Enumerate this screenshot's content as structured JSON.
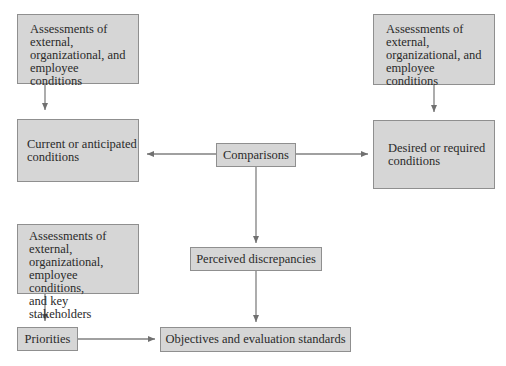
{
  "diagram": {
    "nodes": {
      "assess_current": {
        "label": "Assessments of external, organizational, and employee conditions",
        "lines": [
          "Assessments of",
          "external,",
          "organizational, and",
          "employee conditions"
        ]
      },
      "current": {
        "label": "Current or anticipated conditions",
        "lines": [
          "Current or anticipated",
          "conditions"
        ]
      },
      "comparisons": {
        "label": "Comparisons"
      },
      "assess_desired": {
        "label": "Assessments of external, organizational, and employee conditions",
        "lines": [
          "Assessments of",
          "external,",
          "organizational, and",
          "employee conditions"
        ]
      },
      "desired": {
        "label": "Desired or required conditions",
        "lines": [
          "Desired or required",
          "conditions"
        ]
      },
      "assess_priorities": {
        "label": "Assessments of external, organizational, employee conditions, and key stakeholders",
        "lines": [
          "Assessments of",
          "external,",
          "organizational,",
          "employee conditions,",
          "and key stakeholders"
        ]
      },
      "priorities": {
        "label": "Priorities"
      },
      "discrepancies": {
        "label": "Perceived discrepancies"
      },
      "objectives": {
        "label": "Objectives and evaluation standards"
      }
    },
    "edges": [
      {
        "from": "assess_current",
        "to": "current"
      },
      {
        "from": "comparisons",
        "to": "current"
      },
      {
        "from": "comparisons",
        "to": "desired"
      },
      {
        "from": "assess_desired",
        "to": "desired"
      },
      {
        "from": "comparisons",
        "to": "discrepancies"
      },
      {
        "from": "discrepancies",
        "to": "objectives"
      },
      {
        "from": "assess_priorities",
        "to": "priorities"
      },
      {
        "from": "priorities",
        "to": "objectives"
      }
    ],
    "colors": {
      "box_fill": "#d6d6d6",
      "box_border": "#8f8f8f",
      "arrow": "#707070"
    }
  }
}
